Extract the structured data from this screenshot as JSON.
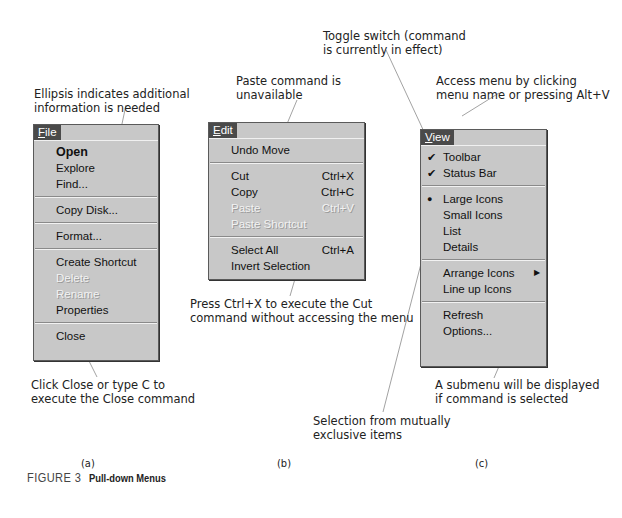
{
  "figure": {
    "number": "FIGURE 3",
    "title": "Pull-down Menus"
  },
  "panels": {
    "a": {
      "label": "(a)",
      "menu": {
        "title": "File",
        "title_mnemonic": "F",
        "items": [
          {
            "label": "Open",
            "mnemonic": "O",
            "bold": true,
            "enabled": true
          },
          {
            "label": "Explore",
            "mnemonic": "E",
            "enabled": true
          },
          {
            "label": "Find...",
            "mnemonic": "F",
            "enabled": true
          },
          {
            "separator": true
          },
          {
            "label": "Copy Disk...",
            "mnemonic": "y",
            "enabled": true
          },
          {
            "separator": true
          },
          {
            "label": "Format...",
            "mnemonic": "m",
            "enabled": true
          },
          {
            "separator": true
          },
          {
            "label": "Create Shortcut",
            "mnemonic": "S",
            "enabled": true
          },
          {
            "label": "Delete",
            "mnemonic": "D",
            "enabled": false
          },
          {
            "label": "Rename",
            "mnemonic": "m",
            "enabled": false
          },
          {
            "label": "Properties",
            "mnemonic": "r",
            "enabled": true
          },
          {
            "separator": true
          },
          {
            "label": "Close",
            "mnemonic": "C",
            "enabled": true
          }
        ]
      },
      "callouts": {
        "top": [
          "Ellipsis indicates additional",
          "information is needed"
        ],
        "bottom": [
          "Click Close or type C to",
          "execute the Close command"
        ]
      }
    },
    "b": {
      "label": "(b)",
      "menu": {
        "title": "Edit",
        "title_mnemonic": "E",
        "items": [
          {
            "label": "Undo Move",
            "mnemonic": "U",
            "enabled": true
          },
          {
            "separator": true
          },
          {
            "label": "Cut",
            "mnemonic": "t",
            "shortcut": "Ctrl+X",
            "enabled": true
          },
          {
            "label": "Copy",
            "mnemonic": "C",
            "shortcut": "Ctrl+C",
            "enabled": true
          },
          {
            "label": "Paste",
            "mnemonic": "P",
            "shortcut": "Ctrl+V",
            "enabled": false
          },
          {
            "label": "Paste Shortcut",
            "mnemonic": "S",
            "enabled": false
          },
          {
            "separator": true
          },
          {
            "label": "Select All",
            "mnemonic": "A",
            "shortcut": "Ctrl+A",
            "enabled": true
          },
          {
            "label": "Invert Selection",
            "mnemonic": "I",
            "enabled": true
          }
        ]
      },
      "callouts": {
        "top": [
          "Paste command is",
          "unavailable"
        ],
        "bottom": [
          "Press Ctrl+X to execute the Cut",
          "command without accessing the menu"
        ]
      }
    },
    "c": {
      "label": "(c)",
      "menu": {
        "title": "View",
        "title_mnemonic": "V",
        "items": [
          {
            "label": "Toolbar",
            "mnemonic": "T",
            "mark": "check",
            "enabled": true
          },
          {
            "label": "Status Bar",
            "mnemonic": "B",
            "mark": "check",
            "enabled": true
          },
          {
            "separator": true
          },
          {
            "label": "Large Icons",
            "mnemonic": "g",
            "mark": "bullet",
            "enabled": true
          },
          {
            "label": "Small Icons",
            "mnemonic": "m",
            "enabled": true
          },
          {
            "label": "List",
            "mnemonic": "L",
            "enabled": true
          },
          {
            "label": "Details",
            "mnemonic": "D",
            "enabled": true
          },
          {
            "separator": true
          },
          {
            "label": "Arrange Icons",
            "mnemonic": "I",
            "submenu": true,
            "enabled": true
          },
          {
            "label": "Line up Icons",
            "mnemonic": "e",
            "enabled": true
          },
          {
            "separator": true
          },
          {
            "label": "Refresh",
            "mnemonic": "R",
            "enabled": true
          },
          {
            "label": "Options...",
            "mnemonic": "O",
            "enabled": true
          }
        ]
      },
      "callouts": {
        "toggle": [
          "Toggle switch (command",
          "is currently in effect)"
        ],
        "access": [
          "Access menu by clicking",
          "menu name or pressing  Alt+V"
        ],
        "submenu": [
          "A submenu will be displayed",
          "if command is selected"
        ],
        "exclusive": [
          "Selection from mutually",
          "exclusive items"
        ]
      }
    }
  },
  "glyphs": {
    "check": "✔",
    "bullet": "●",
    "submenu_arrow": "▶"
  },
  "colors": {
    "menu_bg": "#c8c8c8",
    "menu_title_bg": "#4a4a4a",
    "disabled_text": "#f2f2f2",
    "leader_line": "#8a8a8a"
  }
}
